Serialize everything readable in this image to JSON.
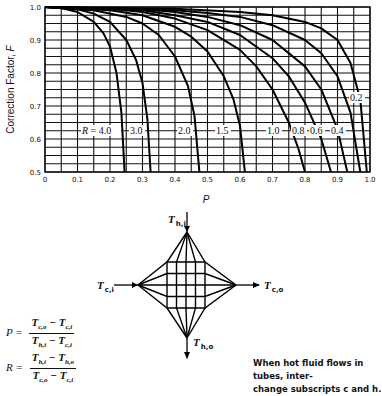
{
  "chart_data": {
    "type": "line",
    "title": "",
    "xlabel": "P",
    "ylabel": "Correction Factor, F",
    "xlim": [
      0,
      1.0
    ],
    "ylim": [
      0.5,
      1.0
    ],
    "grid": true,
    "grid_step_x": 0.05,
    "grid_step_y": 0.025,
    "x_ticks": [
      "0",
      "0.1",
      "0.2",
      "0.3",
      "0.4",
      "0.5",
      "0.6",
      "0.7",
      "0.8",
      "0.9",
      "1.0"
    ],
    "y_ticks": [
      "0.5",
      "0.6",
      "0.7",
      "0.8",
      "0.9",
      "1.0"
    ],
    "series": [
      {
        "name": "R = 4.0",
        "label": "R = 4.0",
        "R": 4.0,
        "x": [
          0,
          0.05,
          0.1,
          0.15,
          0.18,
          0.2,
          0.22,
          0.235,
          0.245
        ],
        "y": [
          1.0,
          0.997,
          0.985,
          0.955,
          0.92,
          0.88,
          0.8,
          0.68,
          0.5
        ]
      },
      {
        "name": "R = 3.0",
        "label": "3.0",
        "R": 3.0,
        "x": [
          0,
          0.1,
          0.15,
          0.2,
          0.25,
          0.28,
          0.3,
          0.315,
          0.325
        ],
        "y": [
          1.0,
          0.993,
          0.98,
          0.955,
          0.9,
          0.84,
          0.77,
          0.66,
          0.5
        ]
      },
      {
        "name": "R = 2.0",
        "label": "2.0",
        "R": 2.0,
        "x": [
          0,
          0.15,
          0.25,
          0.3,
          0.35,
          0.4,
          0.44,
          0.46,
          0.475
        ],
        "y": [
          1.0,
          0.99,
          0.97,
          0.95,
          0.915,
          0.85,
          0.76,
          0.67,
          0.5
        ]
      },
      {
        "name": "R = 1.5",
        "label": "1.5",
        "R": 1.5,
        "x": [
          0,
          0.2,
          0.3,
          0.4,
          0.45,
          0.5,
          0.55,
          0.58,
          0.6,
          0.615
        ],
        "y": [
          1.0,
          0.99,
          0.975,
          0.94,
          0.91,
          0.865,
          0.79,
          0.72,
          0.64,
          0.5
        ]
      },
      {
        "name": "R = 1.0",
        "label": "1.0",
        "R": 1.0,
        "x": [
          0,
          0.2,
          0.3,
          0.4,
          0.5,
          0.6,
          0.65,
          0.7,
          0.75,
          0.78,
          0.8
        ],
        "y": [
          1.0,
          0.995,
          0.985,
          0.965,
          0.93,
          0.87,
          0.82,
          0.75,
          0.65,
          0.57,
          0.5
        ]
      },
      {
        "name": "R = 0.8",
        "label": "0.8",
        "R": 0.8,
        "x": [
          0,
          0.3,
          0.4,
          0.5,
          0.6,
          0.7,
          0.75,
          0.8,
          0.85,
          0.88
        ],
        "y": [
          1.0,
          0.99,
          0.975,
          0.955,
          0.915,
          0.845,
          0.79,
          0.71,
          0.6,
          0.5
        ]
      },
      {
        "name": "R = 0.6",
        "label": "0.6",
        "R": 0.6,
        "x": [
          0,
          0.3,
          0.4,
          0.5,
          0.6,
          0.7,
          0.8,
          0.85,
          0.9,
          0.93
        ],
        "y": [
          1.0,
          0.993,
          0.985,
          0.97,
          0.945,
          0.9,
          0.82,
          0.75,
          0.63,
          0.5
        ]
      },
      {
        "name": "R = 0.4",
        "label": "0.4",
        "R": 0.4,
        "x": [
          0,
          0.4,
          0.5,
          0.6,
          0.7,
          0.8,
          0.85,
          0.9,
          0.94,
          0.97
        ],
        "y": [
          1.0,
          0.99,
          0.982,
          0.97,
          0.945,
          0.9,
          0.86,
          0.79,
          0.68,
          0.5
        ]
      },
      {
        "name": "R = 0.2",
        "label": "0.2",
        "R": 0.2,
        "x": [
          0,
          0.4,
          0.6,
          0.7,
          0.8,
          0.85,
          0.9,
          0.94,
          0.97,
          0.99
        ],
        "y": [
          1.0,
          0.995,
          0.985,
          0.975,
          0.955,
          0.935,
          0.9,
          0.83,
          0.72,
          0.5
        ]
      }
    ]
  },
  "chart": {
    "ylabel": "Correction Factor, F",
    "xlabel": "P",
    "r_label_prefix": "R = 4.0"
  },
  "diagram": {
    "hot_in": {
      "T": "T",
      "sub": "h,i"
    },
    "hot_out": {
      "T": "T",
      "sub": "h,o"
    },
    "cold_in": {
      "T": "T",
      "sub": "c,i"
    },
    "cold_out": {
      "T": "T",
      "sub": "c,o"
    }
  },
  "formulas": {
    "P": {
      "lhs": "P =",
      "numerator": "T c,o − T c,i",
      "denominator": "T h,i − T c,i"
    },
    "R": {
      "lhs": "R =",
      "numerator": "T h,i − T h,o",
      "denominator": "T c,o − T c,i"
    }
  },
  "note": {
    "line1": "When hot fluid flows in tubes, inter-",
    "line2": "change subscripts c and h."
  }
}
